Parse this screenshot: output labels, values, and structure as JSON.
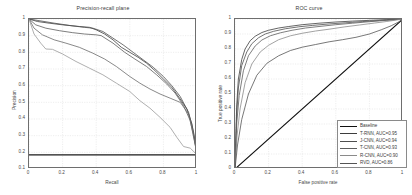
{
  "figure": {
    "width": 412,
    "height": 195,
    "background": "#ffffff",
    "grid_color": "#d9d9d9",
    "axis_color": "#6e6e6e"
  },
  "chart_data": [
    {
      "type": "line",
      "title": "Precision-recall plane",
      "xlabel": "Recall",
      "ylabel": "Precision",
      "xlim": [
        0,
        1
      ],
      "ylim": [
        0.1,
        1
      ],
      "xticks": [
        "0",
        "0.2",
        "0.4",
        "0.6",
        "0.8",
        "1"
      ],
      "xtick_values": [
        0,
        0.2,
        0.4,
        0.6,
        0.8,
        1
      ],
      "yticks": [
        "0.1",
        "0.2",
        "0.3",
        "0.4",
        "0.5",
        "0.6",
        "0.7",
        "0.8",
        "0.9",
        "1"
      ],
      "ytick_values": [
        0.1,
        0.2,
        0.3,
        0.4,
        0.5,
        0.6,
        0.7,
        0.8,
        0.9,
        1
      ],
      "grid": true,
      "legend": "none",
      "series": [
        {
          "name": "Baseline",
          "color": "#1a1a1a",
          "width": 1.4,
          "x": [
            0,
            1
          ],
          "y": [
            0.185,
            0.185
          ]
        },
        {
          "name": "T-RNN, AUC=0.95",
          "color": "#3d3d3d",
          "width": 0.8,
          "x": [
            0,
            0.05,
            0.12,
            0.2,
            0.3,
            0.36,
            0.4,
            0.45,
            0.5,
            0.55,
            0.6,
            0.65,
            0.7,
            0.75,
            0.8,
            0.85,
            0.9,
            0.94,
            0.97,
            1
          ],
          "y": [
            1.0,
            0.985,
            0.975,
            0.965,
            0.955,
            0.95,
            0.935,
            0.91,
            0.875,
            0.83,
            0.8,
            0.77,
            0.735,
            0.69,
            0.64,
            0.59,
            0.52,
            0.46,
            0.37,
            0.19
          ]
        },
        {
          "name": "J-CNN, AUC=0.94",
          "color": "#4f4f4f",
          "width": 0.8,
          "x": [
            0,
            0.06,
            0.15,
            0.25,
            0.33,
            0.38,
            0.44,
            0.5,
            0.56,
            0.62,
            0.68,
            0.74,
            0.8,
            0.85,
            0.9,
            0.95,
            0.98,
            1
          ],
          "y": [
            1.0,
            0.99,
            0.975,
            0.96,
            0.95,
            0.945,
            0.925,
            0.885,
            0.845,
            0.8,
            0.755,
            0.71,
            0.655,
            0.6,
            0.535,
            0.44,
            0.32,
            0.19
          ]
        },
        {
          "name": "T-CNN, AUC=0.93",
          "color": "#5d5d5d",
          "width": 0.8,
          "x": [
            0,
            0.04,
            0.1,
            0.18,
            0.26,
            0.33,
            0.4,
            0.43,
            0.5,
            0.57,
            0.63,
            0.7,
            0.76,
            0.82,
            0.87,
            0.92,
            0.96,
            1
          ],
          "y": [
            1.0,
            0.965,
            0.945,
            0.93,
            0.918,
            0.91,
            0.905,
            0.9,
            0.855,
            0.8,
            0.76,
            0.715,
            0.665,
            0.61,
            0.555,
            0.48,
            0.39,
            0.19
          ]
        },
        {
          "name": "R-CNN, AUC=0.90",
          "color": "#6b6b6b",
          "width": 0.8,
          "x": [
            0,
            0.03,
            0.08,
            0.15,
            0.22,
            0.3,
            0.38,
            0.45,
            0.52,
            0.6,
            0.66,
            0.72,
            0.78,
            0.84,
            0.9,
            0.95,
            0.98,
            1
          ],
          "y": [
            1.0,
            0.945,
            0.905,
            0.875,
            0.855,
            0.83,
            0.795,
            0.76,
            0.715,
            0.655,
            0.615,
            0.58,
            0.55,
            0.525,
            0.5,
            0.43,
            0.3,
            0.19
          ]
        },
        {
          "name": "RVD, AUC=0.86",
          "color": "#9a9a9a",
          "width": 0.8,
          "x": [
            0,
            0.03,
            0.07,
            0.1,
            0.14,
            0.2,
            0.28,
            0.36,
            0.44,
            0.52,
            0.6,
            0.66,
            0.72,
            0.78,
            0.84,
            0.88,
            0.92,
            0.96,
            1
          ],
          "y": [
            1.0,
            0.91,
            0.855,
            0.82,
            0.818,
            0.79,
            0.745,
            0.705,
            0.665,
            0.615,
            0.565,
            0.51,
            0.465,
            0.41,
            0.35,
            0.29,
            0.235,
            0.225,
            0.185
          ]
        }
      ]
    },
    {
      "type": "line",
      "title": "ROC curve",
      "xlabel": "False positive rate",
      "ylabel": "True positive rate",
      "xlim": [
        0,
        1
      ],
      "ylim": [
        0,
        1
      ],
      "xticks": [
        "0",
        "0.2",
        "0.4",
        "0.6",
        "0.8",
        "1"
      ],
      "xtick_values": [
        0,
        0.2,
        0.4,
        0.6,
        0.8,
        1
      ],
      "yticks": [
        "0",
        "0.1",
        "0.2",
        "0.3",
        "0.4",
        "0.5",
        "0.6",
        "0.7",
        "0.8",
        "0.9",
        "1"
      ],
      "ytick_values": [
        0,
        0.1,
        0.2,
        0.3,
        0.4,
        0.5,
        0.6,
        0.7,
        0.8,
        0.9,
        1
      ],
      "grid": true,
      "legend": "lower right",
      "series": [
        {
          "name": "Baseline",
          "color": "#111111",
          "width": 1.1,
          "x": [
            0,
            1
          ],
          "y": [
            0,
            1
          ]
        },
        {
          "name": "T-RNN, AUC=0.95",
          "color": "#3d3d3d",
          "width": 0.8,
          "x": [
            0,
            0.01,
            0.02,
            0.04,
            0.06,
            0.09,
            0.12,
            0.16,
            0.2,
            0.26,
            0.32,
            0.4,
            0.5,
            0.6,
            0.7,
            0.8,
            0.9,
            1
          ],
          "y": [
            0,
            0.42,
            0.6,
            0.73,
            0.8,
            0.855,
            0.885,
            0.91,
            0.925,
            0.94,
            0.95,
            0.962,
            0.972,
            0.98,
            0.986,
            0.991,
            0.996,
            1
          ]
        },
        {
          "name": "J-CNN, AUC=0.94",
          "color": "#4f4f4f",
          "width": 0.8,
          "x": [
            0,
            0.01,
            0.02,
            0.04,
            0.07,
            0.1,
            0.14,
            0.18,
            0.23,
            0.3,
            0.38,
            0.46,
            0.56,
            0.66,
            0.76,
            0.86,
            0.94,
            1
          ],
          "y": [
            0,
            0.36,
            0.54,
            0.69,
            0.78,
            0.835,
            0.875,
            0.9,
            0.918,
            0.935,
            0.948,
            0.957,
            0.967,
            0.975,
            0.983,
            0.99,
            0.995,
            1
          ]
        },
        {
          "name": "T-CNN, AUC=0.93",
          "color": "#5d5d5d",
          "width": 0.8,
          "x": [
            0,
            0.01,
            0.025,
            0.05,
            0.08,
            0.12,
            0.16,
            0.21,
            0.27,
            0.34,
            0.42,
            0.5,
            0.6,
            0.7,
            0.8,
            0.9,
            0.96,
            1
          ],
          "y": [
            0,
            0.3,
            0.49,
            0.655,
            0.755,
            0.82,
            0.86,
            0.888,
            0.908,
            0.925,
            0.94,
            0.95,
            0.962,
            0.972,
            0.982,
            0.991,
            0.996,
            1
          ]
        },
        {
          "name": "R-CNN, AUC=0.90",
          "color": "#8a8a8a",
          "width": 0.8,
          "x": [
            0,
            0.012,
            0.03,
            0.06,
            0.1,
            0.15,
            0.2,
            0.26,
            0.33,
            0.4,
            0.48,
            0.56,
            0.65,
            0.74,
            0.83,
            0.9,
            0.96,
            1
          ],
          "y": [
            0,
            0.22,
            0.4,
            0.575,
            0.7,
            0.78,
            0.825,
            0.862,
            0.888,
            0.905,
            0.92,
            0.932,
            0.947,
            0.96,
            0.973,
            0.983,
            0.993,
            1
          ]
        },
        {
          "name": "RVD, AUC=0.86",
          "color": "#555555",
          "width": 0.8,
          "x": [
            0,
            0.015,
            0.04,
            0.08,
            0.13,
            0.19,
            0.26,
            0.33,
            0.4,
            0.48,
            0.56,
            0.64,
            0.72,
            0.8,
            0.87,
            0.93,
            0.97,
            1
          ],
          "y": [
            0,
            0.16,
            0.33,
            0.5,
            0.625,
            0.705,
            0.755,
            0.79,
            0.812,
            0.83,
            0.848,
            0.862,
            0.878,
            0.9,
            0.928,
            0.955,
            0.978,
            1
          ]
        }
      ]
    }
  ],
  "legend": {
    "title": "",
    "items": [
      {
        "label": "Baseline",
        "color": "#111111",
        "width": 1.5
      },
      {
        "label": "T-RNN, AUC=0.95",
        "color": "#3d3d3d",
        "width": 1.0
      },
      {
        "label": "J-CNN, AUC=0.94",
        "color": "#4f4f4f",
        "width": 1.0
      },
      {
        "label": "T-CNN, AUC=0.93",
        "color": "#5d5d5d",
        "width": 1.0
      },
      {
        "label": "R-CNN, AUC=0.90",
        "color": "#8a8a8a",
        "width": 1.0
      },
      {
        "label": "RVD, AUC=0.86",
        "color": "#555555",
        "width": 1.5
      }
    ]
  }
}
